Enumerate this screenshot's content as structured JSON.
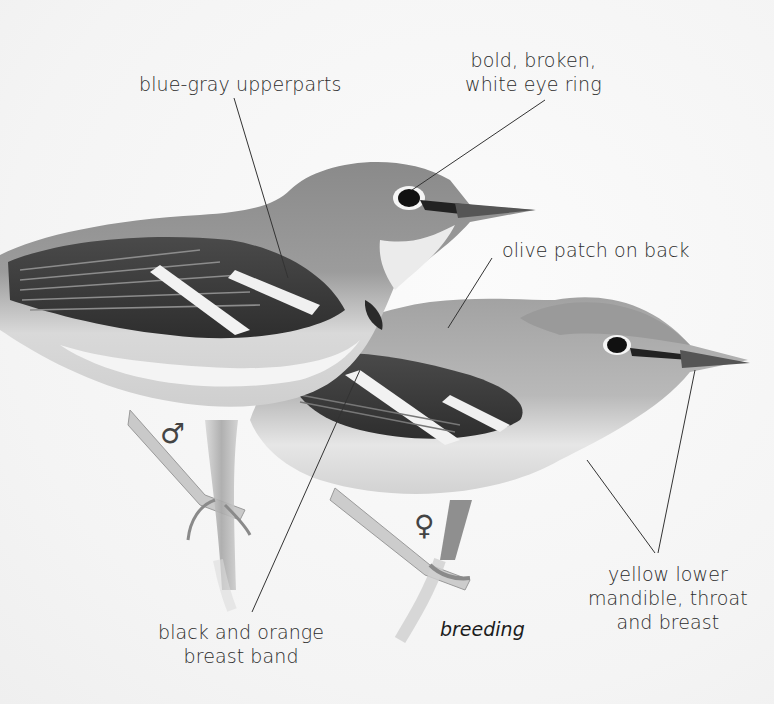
{
  "illustration": {
    "subject": "two warblers perched on branches",
    "palette": {
      "background": "#f6f6f6",
      "ink": "#2c2c2c",
      "bird_upper": "#8f8f8f",
      "bird_dark": "#3a3a3a",
      "bird_light": "#e8e8e8",
      "leader_line": "#333333"
    }
  },
  "labels": {
    "upperparts": {
      "lines": [
        "blue-gray upperparts"
      ]
    },
    "eye_ring": {
      "lines": [
        "bold, broken,",
        "white eye ring"
      ]
    },
    "olive_patch": {
      "lines": [
        "olive patch on back"
      ]
    },
    "yellow_parts": {
      "lines": [
        "yellow lower",
        "mandible, throat",
        "and breast"
      ]
    },
    "breast_band": {
      "lines": [
        "black and orange",
        "breast band"
      ]
    }
  },
  "sex_symbols": {
    "male": "♂",
    "female": "♀"
  },
  "caption": "breeding"
}
